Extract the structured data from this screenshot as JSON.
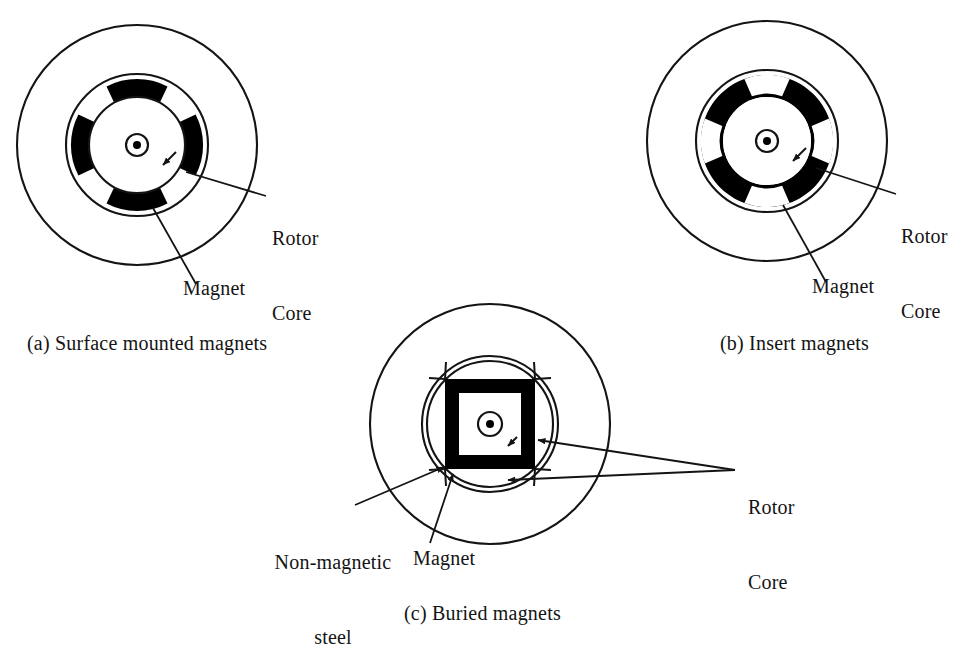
{
  "figure": {
    "background_color": "#ffffff",
    "ink_color": "#141414",
    "magnet_fill": "#000000",
    "core_fill": "#ffffff"
  },
  "diagrams": [
    {
      "id": "a",
      "caption": "(a) Surface mounted magnets",
      "labels": {
        "rotor_core_line1": "Rotor",
        "rotor_core_line2": "Core",
        "magnet": "Magnet"
      },
      "geometry": {
        "center_x": 137,
        "center_y": 145,
        "stator_radius": 120,
        "rotor_outer_radius": 71,
        "magnet_outer_radius": 66,
        "magnet_inner_radius": 48,
        "core_radius": 48,
        "shaft_outer_radius": 11,
        "shaft_dot_radius": 4,
        "pole_count": 4,
        "magnet_arc_span_deg": 62
      }
    },
    {
      "id": "b",
      "caption": "(b) Insert magnets",
      "labels": {
        "rotor_core_line1": "Rotor",
        "rotor_core_line2": "Core",
        "magnet": "Magnet"
      },
      "geometry": {
        "center_x": 767,
        "center_y": 141,
        "stator_radius": 120,
        "rotor_outer_radius": 71,
        "magnet_outer_radius": 66,
        "magnet_inner_radius": 44,
        "core_radius": 44,
        "shaft_outer_radius": 11,
        "shaft_dot_radius": 4,
        "pole_count": 4,
        "notch_span_deg": 40
      }
    },
    {
      "id": "c",
      "caption": "(c) Buried magnets",
      "labels": {
        "rotor_core_line1": "Rotor",
        "rotor_core_line2": "Core",
        "magnet": "Magnet",
        "non_magnetic_steel_line1": "Non-magnetic",
        "non_magnetic_steel_line2": "steel"
      },
      "geometry": {
        "center_x": 490,
        "center_y": 424,
        "stator_radius": 120,
        "rotor_outer_radius": 68,
        "rotor_inner_radius": 63,
        "magnet_square_half": 45,
        "magnet_thickness": 14,
        "shaft_outer_radius": 12,
        "shaft_dot_radius": 4,
        "pole_count": 4
      }
    }
  ],
  "annotations": {
    "a_rotor_core": {
      "x": 272,
      "y": 188,
      "text_line1": "Rotor",
      "text_line2": "Core"
    },
    "a_magnet": {
      "x": 183,
      "y": 287,
      "text": "Magnet"
    },
    "b_rotor_core": {
      "x": 901,
      "y": 186,
      "text_line1": "Rotor",
      "text_line2": "Core"
    },
    "b_magnet": {
      "x": 812,
      "y": 285,
      "text": "Magnet"
    },
    "c_rotor_core": {
      "x": 743,
      "y": 455,
      "text_line1": "Rotor",
      "text_line2": "Core"
    },
    "c_magnet": {
      "x": 413,
      "y": 545,
      "text": "Magnet"
    },
    "c_non_magnetic": {
      "x": 261,
      "y": 511,
      "text_line1": "Non-magnetic",
      "text_line2": "steel"
    }
  },
  "captions": {
    "a": {
      "x": 27,
      "y": 331,
      "text": "(a) Surface mounted magnets"
    },
    "b": {
      "x": 720,
      "y": 331,
      "text": "(b) Insert magnets"
    },
    "c": {
      "x": 404,
      "y": 601,
      "text": "(c) Buried magnets"
    }
  }
}
